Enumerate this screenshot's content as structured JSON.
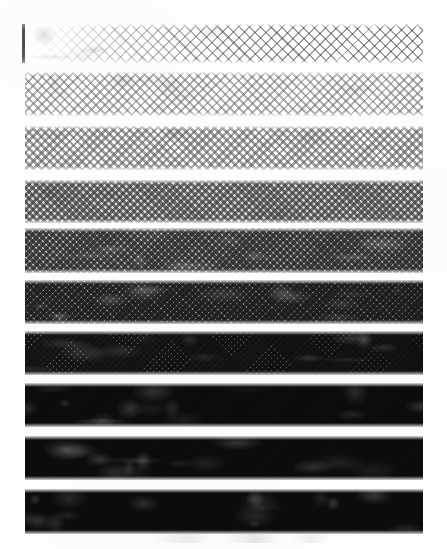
{
  "sheet": {
    "title": "Halftone Density Step Wedge",
    "width": 447,
    "height": 549,
    "background_color": "#fdfdfc",
    "ink_color": "#111111"
  },
  "registration_mark": {
    "label": "registration tick",
    "x": 22,
    "y": 24,
    "width": 3,
    "height": 39,
    "color": "#4a4a4a"
  },
  "footer_smudge": {
    "label": "scan smudge",
    "visible": true
  },
  "chart_data": {
    "type": "bar",
    "subtitle": "Diagonal screen, ten tone steps",
    "xlabel": "",
    "ylabel": "Ink coverage (%)",
    "orientation": "horizontal-bands",
    "grid": false,
    "legend": null,
    "screen_angle_deg": 45,
    "band_left_px": 25,
    "band_right_px": 423,
    "categories": [
      "Step 1",
      "Step 2",
      "Step 3",
      "Step 4",
      "Step 5",
      "Step 6",
      "Step 7",
      "Step 8",
      "Step 9",
      "Step 10"
    ],
    "values": [
      5,
      18,
      30,
      45,
      58,
      70,
      82,
      90,
      94,
      97
    ],
    "ylim": [
      0,
      100
    ],
    "bands": [
      {
        "index": 1,
        "label": "Step 1",
        "coverage": 5,
        "tone_hex": "#3c3c3c",
        "y": 24,
        "height": 39,
        "dot_size": 1.5,
        "pitch": 7.5,
        "gradient": "left-fade",
        "note": "sparse dashes, fades in from left"
      },
      {
        "index": 2,
        "label": "Step 2",
        "coverage": 18,
        "tone_hex": "#3a3a3a",
        "y": 72,
        "height": 44,
        "dot_size": 2.1,
        "pitch": 6.2,
        "gradient": "uniform",
        "note": "even diagonal dot rows"
      },
      {
        "index": 3,
        "label": "Step 3",
        "coverage": 30,
        "tone_hex": "#353535",
        "y": 126,
        "height": 44,
        "dot_size": 2.7,
        "pitch": 5.6,
        "gradient": "uniform",
        "note": "denser diagonal screen"
      },
      {
        "index": 4,
        "label": "Step 4",
        "coverage": 45,
        "tone_hex": "#2f2f2f",
        "y": 180,
        "height": 43,
        "dot_size": 3.1,
        "pitch": 5.0,
        "gradient": "slight-darken-right",
        "note": "mid grey, moire lattice"
      },
      {
        "index": 5,
        "label": "Step 5",
        "coverage": 58,
        "tone_hex": "#2a2a2a",
        "y": 228,
        "height": 45,
        "dot_size": 3.4,
        "pitch": 4.7,
        "gradient": "darken-right",
        "note": "checkerboard tone, light flecks right"
      },
      {
        "index": 6,
        "label": "Step 6",
        "coverage": 70,
        "tone_hex": "#242424",
        "y": 280,
        "height": 44,
        "dot_size": 3.6,
        "pitch": 4.4,
        "gradient": "darken-right",
        "note": "light brush artifact at left"
      },
      {
        "index": 7,
        "label": "Step 7",
        "coverage": 82,
        "tone_hex": "#1d1d1d",
        "y": 331,
        "height": 44,
        "dot_size": 3.8,
        "pitch": 4.2,
        "gradient": "darken-right",
        "note": "speckle cluster upper left"
      },
      {
        "index": 8,
        "label": "Step 8",
        "coverage": 90,
        "tone_hex": "#181818",
        "y": 383,
        "height": 44,
        "dot_size": 4.0,
        "pitch": 4.0,
        "gradient": "uniform",
        "note": "near solid, fine diagonal relief"
      },
      {
        "index": 9,
        "label": "Step 9",
        "coverage": 94,
        "tone_hex": "#141414",
        "y": 436,
        "height": 44,
        "dot_size": 4.1,
        "pitch": 3.9,
        "gradient": "uniform",
        "note": "solid with diagonal sheen"
      },
      {
        "index": 10,
        "label": "Step 10",
        "coverage": 97,
        "tone_hex": "#0e0e0e",
        "y": 489,
        "height": 45,
        "dot_size": 4.2,
        "pitch": 3.8,
        "gradient": "darken-right",
        "note": "deepest tone, faint light strokes"
      }
    ]
  }
}
